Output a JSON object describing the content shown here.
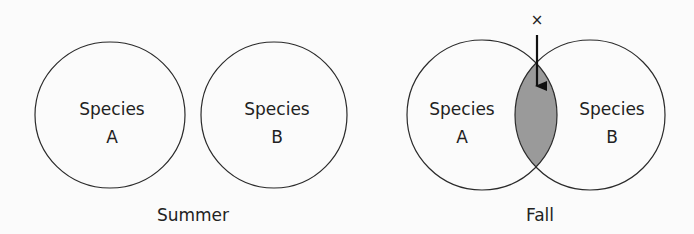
{
  "panels": [
    {
      "caption": "Summer",
      "circles": [
        {
          "line1": "Species",
          "line2": "A"
        },
        {
          "line1": "Species",
          "line2": "B"
        }
      ],
      "overlap": false
    },
    {
      "caption": "Fall",
      "circles": [
        {
          "line1": "Species",
          "line2": "A"
        },
        {
          "line1": "Species",
          "line2": "B"
        }
      ],
      "overlap": true,
      "overlap_fill": "#9a9a9a",
      "marker": "×"
    }
  ]
}
